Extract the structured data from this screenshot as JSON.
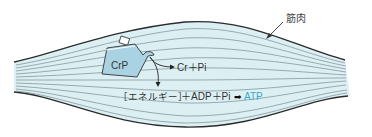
{
  "diagram": {
    "muscle_label": "筋肉",
    "container_label": "CrP",
    "products_label": "Cr＋Pi",
    "reaction": {
      "energy": "［エネルギー］",
      "plus1": "＋ADP＋Pi",
      "arrow": "➡",
      "product": "ATP"
    },
    "colors": {
      "muscle_fill": "#dcf0f4",
      "outline": "#333333",
      "fiber": "#7b8a90",
      "container_fill": "#a9d3e2",
      "atp_text": "#3aa8c8",
      "text": "#333333"
    }
  }
}
